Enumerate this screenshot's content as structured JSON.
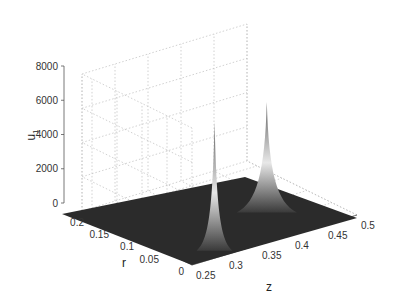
{
  "chart_data": {
    "type": "surface3d",
    "title": "",
    "xlabel": "z",
    "ylabel": "r",
    "zlabel": "u_1",
    "x_ticks": [
      0.25,
      0.3,
      0.35,
      0.4,
      0.45,
      0.5
    ],
    "y_ticks": [
      0,
      0.05,
      0.1,
      0.15,
      0.2
    ],
    "z_ticks": [
      0,
      2000,
      4000,
      6000,
      8000
    ],
    "xlim": [
      0.25,
      0.5
    ],
    "ylim": [
      0,
      0.22
    ],
    "zlim": [
      0,
      8000
    ],
    "grid": true,
    "colormap": "gray",
    "peaks": [
      {
        "z": 0.31,
        "r": 0.0,
        "u1": 4800,
        "width_z": 0.006
      },
      {
        "z": 0.43,
        "r": 0.0,
        "u1": 6200,
        "width_z": 0.01
      }
    ],
    "baseline_u1": 0
  },
  "labels": {
    "x_axis": "z",
    "y_axis": "r",
    "z_axis": "u",
    "z_axis_sub": "1"
  }
}
